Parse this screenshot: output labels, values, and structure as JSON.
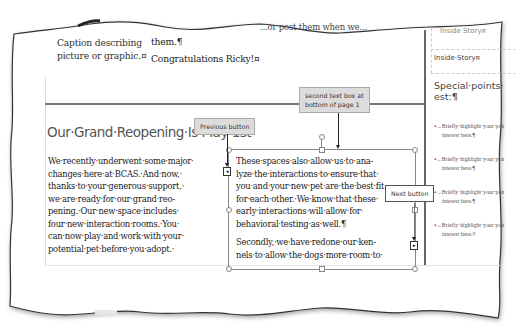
{
  "document": {
    "top_fragment": "...or post them when we...",
    "caption": [
      "Caption describing",
      "picture or graphic.¤"
    ],
    "prev_paragraph_end": "them.¶",
    "congrats": "Congratulations Ricky!¤",
    "heading": "Our·Grand·Reopening·Is·May·1st",
    "left_column_lines": [
      "We·recently·underwent·some·major·",
      "changes·here·at·BCAS.·And·now,·",
      "thanks·to·your·generous·support,·",
      "we·are·ready·for·our·grand·reo-",
      "pening.·Our·new·space·includes·",
      "four·new·interaction·rooms.·You·",
      "can·now·play·and·work·with·your·",
      "potential·pet·before·you·adopt.·"
    ],
    "text_box_lines": [
      "These·spaces·also·allow·us·to·ana-",
      "lyze·the·interactions·to·ensure·that·",
      "you·and·your·new·pet·are·the·best·fit",
      "for·each·other.·We·know·that·these·",
      "early·interactions·will·allow·for·",
      "behavioral·testing·as·well.¶"
    ],
    "text_box_lines_2": [
      "Secondly,·we·have·redone·our·ken-",
      "nels·to·allow·the·dogs·more·room·to·"
    ]
  },
  "sidebar": {
    "inside_story_top": "Inside Story¤",
    "inside_story": "Inside·Story¤",
    "special_points": [
      "Special·points·of·inter-",
      "est:¶"
    ],
    "bullets": [
      {
        "line1": "▪→Briefly·highlight·your·point·of",
        "line2": "interest·here.¶"
      },
      {
        "line1": "▪→Briefly·highlight·your·point·of",
        "line2": "interest·here.¶"
      },
      {
        "line1": "▪→Briefly·highlight·your·point·of",
        "line2": "interest·here.¶"
      },
      {
        "line1": "▪→Briefly·highlight·your·point·of",
        "line2": "interest·here.¤"
      }
    ]
  },
  "callouts": {
    "second_text_box": [
      "second text box at",
      "bottom of page 1"
    ],
    "previous_button": "Previous button",
    "next_button": "Next button"
  },
  "icons": {
    "previous": "◂",
    "next": "▸"
  },
  "colors": {
    "callout_bg": "#dcdcdc",
    "page_bg": "#ffffff",
    "rule": "#777777"
  }
}
